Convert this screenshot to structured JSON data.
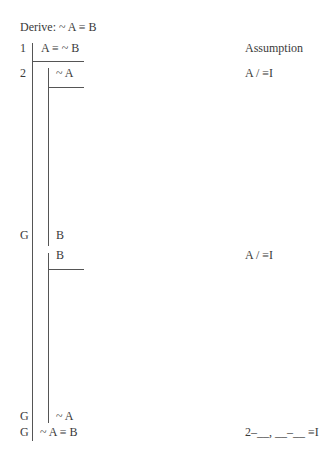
{
  "header": {
    "derive_label": "Derive: ~ A ≡ B"
  },
  "proof": {
    "lines": [
      {
        "num": "1",
        "formula": "A ≡ ~ B",
        "justification": "Assumption"
      },
      {
        "num": "2",
        "formula": "~ A",
        "justification": "A / ≡I"
      },
      {
        "num": "G",
        "formula": "B",
        "justification": ""
      },
      {
        "num": "",
        "formula": "B",
        "justification": "A / ≡I"
      },
      {
        "num": "G",
        "formula": "~ A",
        "justification": ""
      },
      {
        "num": "G",
        "formula": "~ A ≡ B",
        "justification": "2–__, __–__ ≡I"
      }
    ]
  }
}
